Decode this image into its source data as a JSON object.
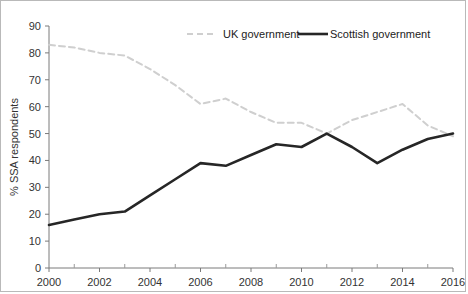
{
  "chart_data": {
    "type": "line",
    "title": "",
    "xlabel": "",
    "ylabel": "% SSA respondents",
    "xlim": [
      2000,
      2016
    ],
    "ylim": [
      0,
      90
    ],
    "grid": false,
    "legend_position": "top",
    "x": [
      2000,
      2001,
      2002,
      2003,
      2004,
      2005,
      2006,
      2007,
      2008,
      2009,
      2010,
      2011,
      2012,
      2013,
      2014,
      2015,
      2016
    ],
    "y_ticks": [
      0,
      10,
      20,
      30,
      40,
      50,
      60,
      70,
      80,
      90
    ],
    "x_ticks": [
      2000,
      2002,
      2004,
      2006,
      2008,
      2010,
      2012,
      2014,
      2016
    ],
    "x_minor_ticks": [
      2001,
      2003,
      2005,
      2007,
      2009,
      2011,
      2013,
      2015
    ],
    "series": [
      {
        "name": "UK government",
        "style": "dashed",
        "color": "#cfcfcf",
        "values": [
          83,
          82,
          80,
          79,
          74,
          68,
          61,
          63,
          58,
          54,
          54,
          50,
          55,
          58,
          61,
          53,
          49
        ]
      },
      {
        "name": "Scottish government",
        "style": "solid",
        "color": "#262626",
        "values": [
          16,
          18,
          20,
          21,
          27,
          33,
          39,
          38,
          42,
          46,
          45,
          50,
          45,
          39,
          44,
          48,
          50
        ]
      }
    ]
  },
  "legend": {
    "items": [
      {
        "label": "UK government"
      },
      {
        "label": "Scottish government"
      }
    ]
  },
  "axes": {
    "y_title": "% SSA respondents",
    "y_tick_labels": [
      "0",
      "10",
      "20",
      "30",
      "40",
      "50",
      "60",
      "70",
      "80",
      "90"
    ],
    "x_tick_labels": [
      "2000",
      "2002",
      "2004",
      "2006",
      "2008",
      "2010",
      "2012",
      "2014",
      "2016"
    ]
  }
}
